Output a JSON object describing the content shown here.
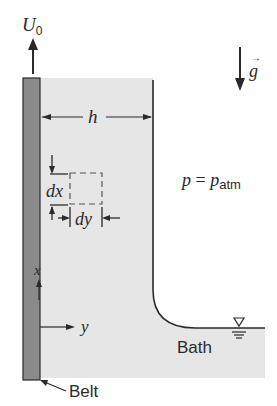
{
  "figure": {
    "type": "fluid-mechanics-schematic",
    "colors": {
      "belt_fill": "#8a8a8a",
      "liquid_fill": "#e6e6e6",
      "line": "#2a2a2a",
      "background": "#ffffff"
    }
  },
  "labels": {
    "velocity": "U",
    "velocity_sub": "0",
    "gravity": "g",
    "film_thickness": "h",
    "dx": "dx",
    "dy": "dy",
    "pressure_lhs": "p",
    "pressure_eq": " = ",
    "pressure_rhs": "p",
    "pressure_sub": "atm",
    "x_axis": "x",
    "y_axis": "y",
    "bath": "Bath",
    "belt": "Belt"
  }
}
